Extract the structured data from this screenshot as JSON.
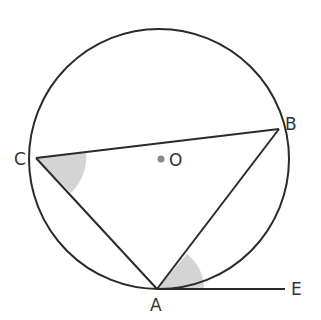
{
  "diagram": {
    "labels": {
      "A": "A",
      "B": "B",
      "C": "C",
      "O": "O",
      "E": "E"
    },
    "colors": {
      "stroke": "#2a2a2a",
      "shade": "#d4d4d4",
      "center_dot": "#888888"
    },
    "points": {
      "O": [
        159,
        160
      ],
      "A": [
        157,
        289
      ],
      "B": [
        279,
        129
      ],
      "C": [
        36,
        158
      ],
      "E": [
        285,
        289
      ]
    },
    "circle_radius": 130
  }
}
